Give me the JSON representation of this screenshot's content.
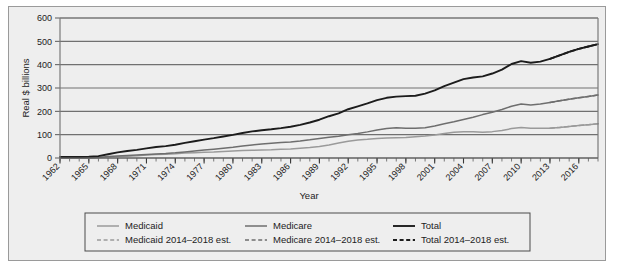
{
  "chart_data": {
    "type": "line",
    "title": "",
    "xlabel": "Year",
    "ylabel": "Real $ billions",
    "xlim": [
      1962,
      2018
    ],
    "ylim": [
      0,
      600
    ],
    "yticks": [
      0,
      100,
      200,
      300,
      400,
      500,
      600
    ],
    "xticks": [
      1962,
      1965,
      1968,
      1971,
      1974,
      1977,
      1980,
      1983,
      1986,
      1989,
      1992,
      1995,
      1998,
      2001,
      2004,
      2007,
      2010,
      2013,
      2016
    ],
    "minor_xtick_interval": 1,
    "grid": "horizontal",
    "legend_position": "below",
    "legend": [
      {
        "label": "Medicaid",
        "style": "solid",
        "color": "#9a9a9a"
      },
      {
        "label": "Medicare",
        "style": "solid",
        "color": "#6e6e6e"
      },
      {
        "label": "Total",
        "style": "solid",
        "color": "#1c1c1c"
      },
      {
        "label": "Medicaid 2014–2018 est.",
        "style": "dashed",
        "color": "#9a9a9a"
      },
      {
        "label": "Medicare 2014–2018 est.",
        "style": "dashed",
        "color": "#6e6e6e"
      },
      {
        "label": "Total 2014–2018 est.",
        "style": "dashed",
        "color": "#1c1c1c"
      }
    ],
    "x": [
      1962,
      1963,
      1964,
      1965,
      1966,
      1967,
      1968,
      1969,
      1970,
      1971,
      1972,
      1973,
      1974,
      1975,
      1976,
      1977,
      1978,
      1979,
      1980,
      1981,
      1982,
      1983,
      1984,
      1985,
      1986,
      1987,
      1988,
      1989,
      1990,
      1991,
      1992,
      1993,
      1994,
      1995,
      1996,
      1997,
      1998,
      1999,
      2000,
      2001,
      2002,
      2003,
      2004,
      2005,
      2006,
      2007,
      2008,
      2009,
      2010,
      2011,
      2012,
      2013,
      2014,
      2015,
      2016,
      2017,
      2018
    ],
    "series": [
      {
        "name": "Medicaid",
        "style": "solid",
        "color": "#9a9a9a",
        "values": [
          0,
          0,
          0,
          0,
          1,
          3,
          6,
          8,
          10,
          13,
          15,
          16,
          18,
          21,
          23,
          25,
          26,
          28,
          30,
          32,
          33,
          34,
          35,
          37,
          39,
          42,
          45,
          49,
          56,
          64,
          72,
          77,
          80,
          84,
          86,
          87,
          88,
          91,
          94,
          99,
          105,
          110,
          113,
          112,
          110,
          113,
          118,
          126,
          131,
          128,
          127,
          128,
          131,
          135,
          139,
          143,
          147
        ]
      },
      {
        "name": "Medicaid 2014–2018 est.",
        "style": "dashed",
        "color": "#9a9a9a",
        "values": [
          null,
          null,
          null,
          null,
          null,
          null,
          null,
          null,
          null,
          null,
          null,
          null,
          null,
          null,
          null,
          null,
          null,
          null,
          null,
          null,
          null,
          null,
          null,
          null,
          null,
          null,
          null,
          null,
          null,
          null,
          null,
          null,
          null,
          null,
          null,
          null,
          null,
          null,
          null,
          null,
          null,
          null,
          null,
          null,
          null,
          null,
          null,
          null,
          null,
          null,
          null,
          128,
          131,
          135,
          139,
          143,
          147
        ]
      },
      {
        "name": "Medicare",
        "style": "solid",
        "color": "#6e6e6e",
        "values": [
          0,
          0,
          0,
          0,
          2,
          6,
          9,
          11,
          13,
          15,
          17,
          19,
          22,
          26,
          30,
          34,
          38,
          42,
          46,
          51,
          56,
          60,
          63,
          66,
          69,
          73,
          78,
          84,
          89,
          93,
          100,
          105,
          112,
          120,
          126,
          130,
          128,
          127,
          130,
          137,
          147,
          155,
          165,
          175,
          186,
          196,
          208,
          222,
          231,
          227,
          231,
          238,
          245,
          252,
          258,
          264,
          270
        ]
      },
      {
        "name": "Medicare 2014–2018 est.",
        "style": "dashed",
        "color": "#6e6e6e",
        "values": [
          null,
          null,
          null,
          null,
          null,
          null,
          null,
          null,
          null,
          null,
          null,
          null,
          null,
          null,
          null,
          null,
          null,
          null,
          null,
          null,
          null,
          null,
          null,
          null,
          null,
          null,
          null,
          null,
          null,
          null,
          null,
          null,
          null,
          null,
          null,
          null,
          null,
          null,
          null,
          null,
          null,
          null,
          null,
          null,
          null,
          null,
          null,
          null,
          null,
          null,
          null,
          238,
          245,
          252,
          258,
          264,
          270
        ]
      },
      {
        "name": "Total",
        "style": "solid",
        "color": "#1c1c1c",
        "values": [
          5,
          5,
          5,
          6,
          8,
          16,
          24,
          30,
          35,
          41,
          47,
          51,
          57,
          65,
          72,
          79,
          85,
          92,
          99,
          107,
          114,
          119,
          123,
          128,
          134,
          142,
          152,
          164,
          179,
          191,
          209,
          221,
          234,
          248,
          258,
          263,
          265,
          267,
          276,
          290,
          308,
          323,
          338,
          345,
          350,
          362,
          379,
          403,
          415,
          408,
          413,
          425,
          440,
          455,
          468,
          478,
          488
        ]
      },
      {
        "name": "Total 2014–2018 est.",
        "style": "dashed",
        "color": "#1c1c1c",
        "values": [
          null,
          null,
          null,
          null,
          null,
          null,
          null,
          null,
          null,
          null,
          null,
          null,
          null,
          null,
          null,
          null,
          null,
          null,
          null,
          null,
          null,
          null,
          null,
          null,
          null,
          null,
          null,
          null,
          null,
          null,
          null,
          null,
          null,
          null,
          null,
          null,
          null,
          null,
          null,
          null,
          null,
          null,
          null,
          null,
          null,
          null,
          null,
          null,
          null,
          null,
          null,
          425,
          440,
          455,
          468,
          478,
          488
        ]
      }
    ]
  },
  "colors": {
    "medicaid": "#9a9a9a",
    "medicare": "#6e6e6e",
    "total": "#1c1c1c",
    "grid": "#707070",
    "panel_background": "#eeeeee",
    "frame_border": "#9a9a9a"
  }
}
